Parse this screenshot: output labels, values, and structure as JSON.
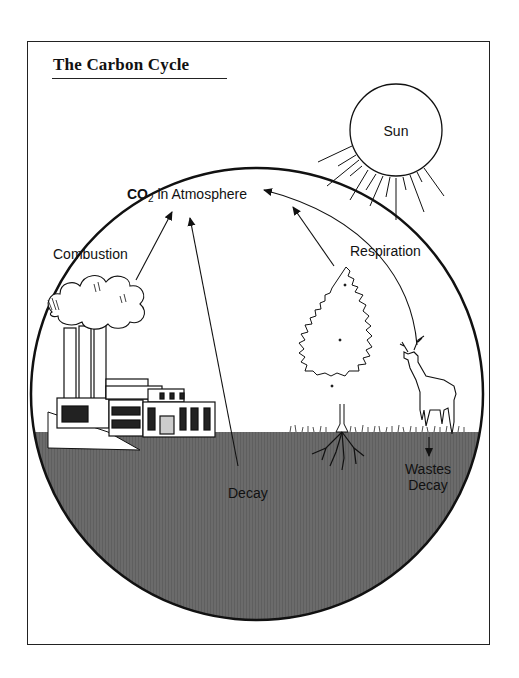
{
  "title": "The Carbon Cycle",
  "labels": {
    "sun": "Sun",
    "co2_prefix": "CO",
    "co2_subscript": "2",
    "co2_suffix": " in Atmosphere",
    "combustion": "Combustion",
    "respiration": "Respiration",
    "decay": "Decay",
    "wastes": "Wastes",
    "wastes_decay": "Decay"
  },
  "elements": {
    "sun": "sun-icon",
    "factory": "factory-icon",
    "smoke_cloud": "smoke-cloud-icon",
    "tree": "tree-icon",
    "roots": "tree-roots-icon",
    "deer": "deer-icon",
    "ground": "ground-soil",
    "earth_circle": "earth-circle"
  },
  "colors": {
    "ink": "#111111",
    "ground": "#6b6b6b",
    "paper": "#ffffff"
  }
}
